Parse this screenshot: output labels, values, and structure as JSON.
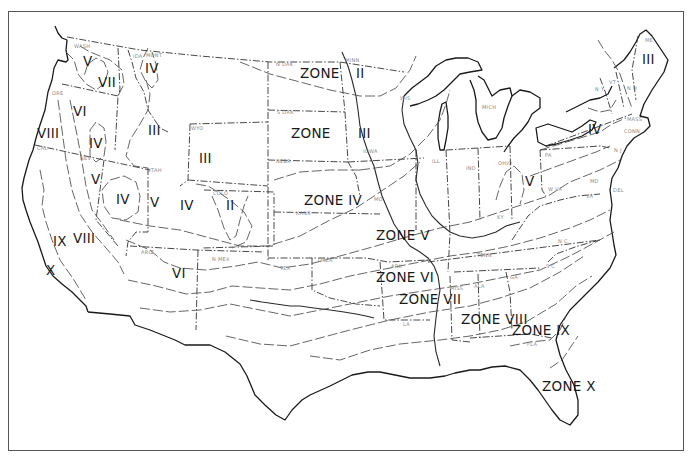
{
  "map": {
    "frame": {
      "x": 8,
      "y": 11,
      "width": 676,
      "height": 440
    },
    "colors": {
      "line": "#1a1a1a",
      "state_boundary": "#333333",
      "zone_line": "#555555",
      "state_label": "#888888",
      "background": "#ffffff"
    },
    "zone_labels": [
      {
        "text": "V",
        "x": 83,
        "y": 66
      },
      {
        "text": "VII",
        "x": 98,
        "y": 87
      },
      {
        "text": "IV",
        "x": 145,
        "y": 73
      },
      {
        "text": "VI",
        "x": 73,
        "y": 116
      },
      {
        "text": "VIII",
        "x": 37,
        "y": 138
      },
      {
        "text": "IV",
        "x": 89,
        "y": 148
      },
      {
        "text": "III",
        "x": 148,
        "y": 135
      },
      {
        "text": "III",
        "x": 199,
        "y": 163
      },
      {
        "text": "V",
        "x": 91,
        "y": 184
      },
      {
        "text": "IV",
        "x": 116,
        "y": 204
      },
      {
        "text": "V",
        "x": 150,
        "y": 207
      },
      {
        "text": "IV",
        "x": 180,
        "y": 210
      },
      {
        "text": "II",
        "x": 226,
        "y": 210
      },
      {
        "text": "IX",
        "x": 53,
        "y": 246
      },
      {
        "text": "VIII",
        "x": 73,
        "y": 243
      },
      {
        "text": "X",
        "x": 46,
        "y": 275
      },
      {
        "text": "VI",
        "x": 172,
        "y": 278
      },
      {
        "text": "ZONE",
        "x": 300,
        "y": 78
      },
      {
        "text": "II",
        "x": 356,
        "y": 78
      },
      {
        "text": "ZONE",
        "x": 291,
        "y": 138
      },
      {
        "text": "III",
        "x": 358,
        "y": 138
      },
      {
        "text": "ZONE IV",
        "x": 304,
        "y": 205
      },
      {
        "text": "ZONE V",
        "x": 376,
        "y": 240
      },
      {
        "text": "ZONE VI",
        "x": 376,
        "y": 282
      },
      {
        "text": "ZONE VII",
        "x": 399,
        "y": 304
      },
      {
        "text": "ZONE VIII",
        "x": 461,
        "y": 324
      },
      {
        "text": "ZONE IX",
        "x": 512,
        "y": 335
      },
      {
        "text": "ZONE X",
        "x": 542,
        "y": 391
      },
      {
        "text": "V",
        "x": 525,
        "y": 186
      },
      {
        "text": "IV",
        "x": 588,
        "y": 134
      },
      {
        "text": "III",
        "x": 642,
        "y": 64
      }
    ],
    "state_labels": [
      {
        "text": "WASH",
        "x": 74,
        "y": 48
      },
      {
        "text": "IDA",
        "x": 133,
        "y": 58
      },
      {
        "text": "MONT",
        "x": 146,
        "y": 57
      },
      {
        "text": "ORE",
        "x": 52,
        "y": 95
      },
      {
        "text": "WYO",
        "x": 191,
        "y": 130
      },
      {
        "text": "CAL",
        "x": 37,
        "y": 150
      },
      {
        "text": "NEV",
        "x": 80,
        "y": 160
      },
      {
        "text": "UTAH",
        "x": 147,
        "y": 172
      },
      {
        "text": "COLO",
        "x": 213,
        "y": 195
      },
      {
        "text": "ARIZ",
        "x": 141,
        "y": 254
      },
      {
        "text": "N MEX",
        "x": 212,
        "y": 261
      },
      {
        "text": "N DAK",
        "x": 276,
        "y": 66
      },
      {
        "text": "MINN",
        "x": 345,
        "y": 62
      },
      {
        "text": "S DAK",
        "x": 277,
        "y": 114
      },
      {
        "text": "NEBR",
        "x": 276,
        "y": 163
      },
      {
        "text": "KANS",
        "x": 296,
        "y": 215
      },
      {
        "text": "OKLA",
        "x": 318,
        "y": 262
      },
      {
        "text": "TEX",
        "x": 280,
        "y": 270
      },
      {
        "text": "WIS",
        "x": 400,
        "y": 100
      },
      {
        "text": "IOWA",
        "x": 363,
        "y": 153
      },
      {
        "text": "MO",
        "x": 374,
        "y": 201
      },
      {
        "text": "ARK",
        "x": 391,
        "y": 268
      },
      {
        "text": "LA",
        "x": 403,
        "y": 326
      },
      {
        "text": "ILL",
        "x": 432,
        "y": 163
      },
      {
        "text": "IND",
        "x": 466,
        "y": 170
      },
      {
        "text": "OHIO",
        "x": 498,
        "y": 165
      },
      {
        "text": "MICH",
        "x": 482,
        "y": 109
      },
      {
        "text": "KY",
        "x": 497,
        "y": 219
      },
      {
        "text": "TENN",
        "x": 477,
        "y": 257
      },
      {
        "text": "MISS",
        "x": 450,
        "y": 290
      },
      {
        "text": "ALA",
        "x": 474,
        "y": 288
      },
      {
        "text": "GA",
        "x": 510,
        "y": 279
      },
      {
        "text": "FLA",
        "x": 527,
        "y": 346
      },
      {
        "text": "S C",
        "x": 546,
        "y": 268
      },
      {
        "text": "N C",
        "x": 558,
        "y": 243
      },
      {
        "text": "VA",
        "x": 586,
        "y": 198
      },
      {
        "text": "W VA",
        "x": 548,
        "y": 191
      },
      {
        "text": "PA",
        "x": 545,
        "y": 157
      },
      {
        "text": "N Y",
        "x": 595,
        "y": 91
      },
      {
        "text": "MD",
        "x": 590,
        "y": 183
      },
      {
        "text": "DEL",
        "x": 613,
        "y": 192
      },
      {
        "text": "N J",
        "x": 614,
        "y": 152
      },
      {
        "text": "CONN",
        "x": 624,
        "y": 133
      },
      {
        "text": "MASS",
        "x": 627,
        "y": 121
      },
      {
        "text": "VT",
        "x": 609,
        "y": 84
      },
      {
        "text": "N H",
        "x": 627,
        "y": 90
      },
      {
        "text": "ME",
        "x": 645,
        "y": 42
      }
    ]
  }
}
